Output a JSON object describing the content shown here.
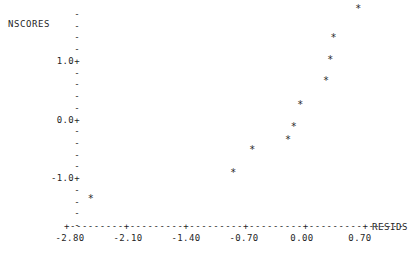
{
  "chart_data": {
    "type": "scatter",
    "title": "",
    "subtitle": "",
    "xlabel": "RESIDS",
    "ylabel": "NSCORES",
    "xlim": [
      -2.8,
      1.05
    ],
    "ylim": [
      -1.75,
      2.05
    ],
    "grid": false,
    "legend": null,
    "marker": "*",
    "x": [
      -2.55,
      -0.83,
      -0.6,
      -0.17,
      -0.1,
      -0.02,
      0.29,
      0.34,
      0.38,
      0.68
    ],
    "y": [
      -1.5,
      -1.05,
      -0.65,
      -0.48,
      -0.26,
      0.12,
      0.53,
      0.9,
      1.27,
      1.78
    ],
    "points": [
      {
        "x": -2.55,
        "y": -1.5,
        "marker": "*"
      },
      {
        "x": -0.83,
        "y": -1.05,
        "marker": "*"
      },
      {
        "x": -0.6,
        "y": -0.65,
        "marker": "*"
      },
      {
        "x": -0.17,
        "y": -0.48,
        "marker": "*"
      },
      {
        "x": -0.1,
        "y": -0.26,
        "marker": "*"
      },
      {
        "x": -0.02,
        "y": 0.12,
        "marker": "*"
      },
      {
        "x": 0.29,
        "y": 0.53,
        "marker": "*"
      },
      {
        "x": 0.34,
        "y": 0.9,
        "marker": "*"
      },
      {
        "x": 0.38,
        "y": 1.27,
        "marker": "*"
      },
      {
        "x": 0.68,
        "y": 1.78,
        "marker": "*"
      }
    ],
    "xticks": [
      -2.8,
      -2.1,
      -1.4,
      -0.7,
      0.0,
      0.7
    ],
    "xticklabels": [
      "-2.80",
      "-2.10",
      "-1.40",
      "-0.70",
      "0.00",
      "0.70"
    ],
    "yticks": [
      1.0,
      0.0,
      -1.0
    ],
    "yticklabels": [
      "1.0+",
      "0.0+",
      "-1.0+"
    ]
  },
  "axes": {
    "y_axis_name": "NSCORES",
    "x_axis_name": "RESIDS",
    "y_rows": [
      {
        "label": "",
        "tick": "-"
      },
      {
        "label": "",
        "tick": "-"
      },
      {
        "label": "",
        "tick": "-"
      },
      {
        "label": "",
        "tick": "-"
      },
      {
        "label": "1.0",
        "tick": "+"
      },
      {
        "label": "",
        "tick": "-"
      },
      {
        "label": "",
        "tick": "-"
      },
      {
        "label": "",
        "tick": "-"
      },
      {
        "label": "",
        "tick": "-"
      },
      {
        "label": "0.0",
        "tick": "+"
      },
      {
        "label": "",
        "tick": "-"
      },
      {
        "label": "",
        "tick": "-"
      },
      {
        "label": "",
        "tick": "-"
      },
      {
        "label": "",
        "tick": "-"
      },
      {
        "label": "-1.0",
        "tick": "+"
      },
      {
        "label": "",
        "tick": "-"
      },
      {
        "label": "",
        "tick": "-"
      },
      {
        "label": "",
        "tick": "-"
      },
      {
        "label": "",
        "tick": "-"
      }
    ],
    "x_axis_line": "+---------+---------+---------+---------+---------+------"
  },
  "colors": {
    "background": "#ffffff",
    "foreground": "#1f1f1f",
    "marker": "#2a2a2a"
  }
}
